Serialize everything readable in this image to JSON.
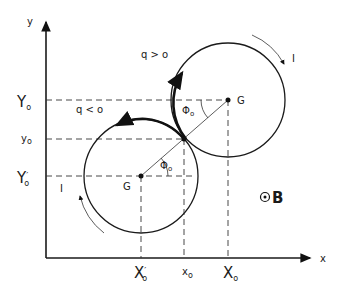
{
  "diagram": {
    "axes": {
      "x_label": "x",
      "y_label": "y"
    },
    "y_ticks": [
      {
        "main": "Y",
        "sub": "o",
        "prime": "",
        "name": "Y0-label"
      },
      {
        "main": "y",
        "sub": "o",
        "prime": "",
        "name": "y0-label"
      },
      {
        "main": "Y",
        "sub": "o",
        "prime": "′",
        "name": "Y0-prime-label"
      }
    ],
    "x_ticks": [
      {
        "main": "X",
        "sub": "o",
        "prime": "′",
        "name": "X0-prime-label"
      },
      {
        "main": "x",
        "sub": "o",
        "prime": "",
        "name": "x0-label"
      },
      {
        "main": "X",
        "sub": "o",
        "prime": "",
        "name": "X0-label"
      }
    ],
    "upper_orbit": {
      "center_label": "G",
      "charge_label": "q > o",
      "current_label": "I",
      "angle_label": "Φ",
      "angle_sub": "o"
    },
    "lower_orbit": {
      "center_label": "G",
      "charge_label": "q < o",
      "current_label": "I",
      "angle_label": "Φ",
      "angle_sub": "o"
    },
    "field": {
      "symbol": "B",
      "direction": "out-of-page"
    }
  }
}
